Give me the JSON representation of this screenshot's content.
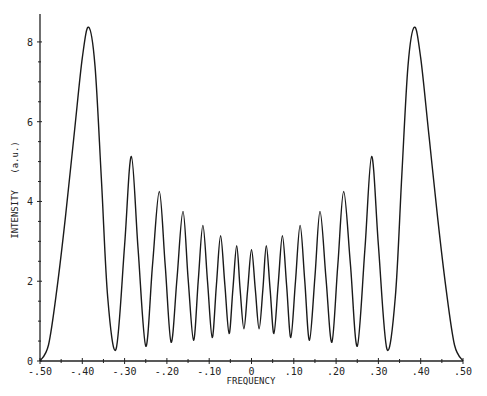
{
  "chart_data": {
    "type": "line",
    "title": "",
    "xlabel": "FREQUENCY",
    "ylabel": "INTENSITY   (a.u.)",
    "xlim": [
      -0.5,
      0.5
    ],
    "ylim": [
      0,
      8.6
    ],
    "grid": false,
    "legend": null,
    "x_ticks": [
      -0.5,
      -0.4,
      -0.3,
      -0.2,
      -0.1,
      0,
      0.1,
      0.2,
      0.3,
      0.4,
      0.5
    ],
    "x_tick_labels": [
      "-.50",
      "-.40",
      "-.30",
      "-.20",
      "-.10",
      "0",
      ".10",
      ".20",
      ".30",
      ".40",
      ".50"
    ],
    "x_minor_ticks": [
      -0.45,
      -0.35,
      -0.25,
      -0.15,
      -0.05,
      0.05,
      0.15,
      0.25,
      0.35,
      0.45
    ],
    "y_ticks": [
      0,
      2,
      4,
      6,
      8
    ],
    "y_tick_labels": [
      "0",
      "2",
      "4",
      "6",
      "8"
    ],
    "y_minor_ticks": [
      0.5,
      1,
      1.5,
      2.5,
      3,
      3.5,
      4.5,
      5,
      5.5,
      6.5,
      7,
      7.5
    ],
    "series": [
      {
        "name": "intensity",
        "color": "#1a1a1a",
        "x": [
          -0.5,
          -0.48,
          -0.46,
          -0.44,
          -0.42,
          -0.4,
          -0.385,
          -0.37,
          -0.355,
          -0.34,
          -0.32,
          -0.3,
          -0.284,
          -0.268,
          -0.25,
          -0.234,
          -0.218,
          -0.204,
          -0.19,
          -0.176,
          -0.162,
          -0.15,
          -0.137,
          -0.126,
          -0.115,
          -0.104,
          -0.093,
          -0.083,
          -0.073,
          -0.063,
          -0.053,
          -0.044,
          -0.035,
          -0.027,
          -0.018,
          -0.009,
          0.0,
          0.009,
          0.018,
          0.027,
          0.035,
          0.044,
          0.053,
          0.063,
          0.073,
          0.083,
          0.093,
          0.104,
          0.115,
          0.126,
          0.137,
          0.15,
          0.162,
          0.176,
          0.19,
          0.204,
          0.218,
          0.234,
          0.25,
          0.268,
          0.284,
          0.3,
          0.32,
          0.34,
          0.355,
          0.37,
          0.385,
          0.4,
          0.42,
          0.44,
          0.46,
          0.48,
          0.5
        ],
        "y": [
          0.0,
          0.4,
          1.8,
          3.6,
          5.6,
          7.6,
          8.37,
          7.4,
          4.6,
          1.6,
          0.3,
          2.9,
          5.13,
          2.8,
          0.37,
          2.4,
          4.25,
          2.4,
          0.47,
          2.1,
          3.75,
          2.1,
          0.52,
          2.0,
          3.4,
          2.0,
          0.59,
          1.9,
          3.14,
          1.9,
          0.69,
          1.8,
          2.89,
          1.8,
          0.81,
          1.8,
          2.79,
          1.8,
          0.81,
          1.8,
          2.89,
          1.8,
          0.69,
          1.9,
          3.14,
          1.9,
          0.59,
          2.0,
          3.4,
          2.0,
          0.52,
          2.1,
          3.75,
          2.1,
          0.47,
          2.4,
          4.25,
          2.4,
          0.37,
          2.8,
          5.13,
          2.9,
          0.3,
          1.6,
          4.6,
          7.4,
          8.37,
          7.6,
          5.6,
          3.6,
          1.8,
          0.4,
          0.0
        ]
      }
    ],
    "peaks": [
      {
        "x": -0.385,
        "y": 8.37
      },
      {
        "x": -0.284,
        "y": 5.13
      },
      {
        "x": -0.218,
        "y": 4.25
      },
      {
        "x": -0.162,
        "y": 3.75
      },
      {
        "x": -0.115,
        "y": 3.4
      },
      {
        "x": -0.073,
        "y": 3.14
      },
      {
        "x": -0.035,
        "y": 2.89
      },
      {
        "x": 0.0,
        "y": 2.79
      },
      {
        "x": 0.035,
        "y": 2.89
      },
      {
        "x": 0.073,
        "y": 3.14
      },
      {
        "x": 0.115,
        "y": 3.4
      },
      {
        "x": 0.162,
        "y": 3.75
      },
      {
        "x": 0.218,
        "y": 4.25
      },
      {
        "x": 0.284,
        "y": 5.13
      },
      {
        "x": 0.385,
        "y": 8.37
      }
    ]
  },
  "plot_area": {
    "left": 40,
    "right": 463,
    "top": 18,
    "bottom": 361
  }
}
